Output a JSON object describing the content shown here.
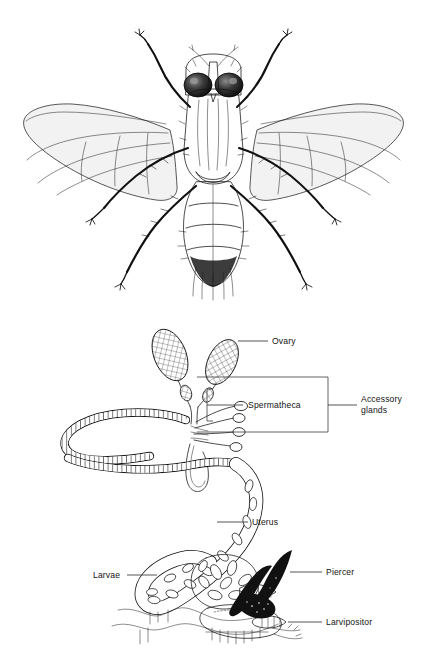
{
  "figure": {
    "background_color": "#ffffff",
    "ink_color": "#111111",
    "label_color": "#141414",
    "panels": [
      {
        "id": "fly-panel",
        "name": "adult-tsetse-fly-illustration",
        "caption": "",
        "description": "Dorsal view line drawing of an adult tsetse fly with outspread wings, six legs, large compound eyes and a banded abdomen"
      },
      {
        "id": "tract-panel",
        "name": "female-reproductive-tract-diagram",
        "caption": "",
        "description": "Labelled line diagram of the female tsetse reproductive tract showing ovaries, spermathecae, accessory glands, coiled uterus with larvae, piercer and larvipositor"
      }
    ]
  },
  "labels": {
    "ovary": "Ovary",
    "spermatheca": "Spermatheca",
    "accessory_glands_line1": "Accessory",
    "accessory_glands_line2": "glands",
    "uterus": "Uterus",
    "larvae": "Larvae",
    "piercer": "Piercer",
    "larvipositor": "Larvipositor"
  },
  "structures": [
    {
      "name": "ovary",
      "label": "Ovary",
      "count": 2,
      "note": "paired cross-hatched ovoid ovaries at top of tract"
    },
    {
      "name": "spermatheca",
      "label": "Spermatheca",
      "count": 4,
      "note": "slender club-tipped ducts grouped by an inner bracket"
    },
    {
      "name": "accessory-glands",
      "label": "Accessory glands",
      "count": 1,
      "note": "outer bracket enclosing spermathecae and gland duct"
    },
    {
      "name": "uterus",
      "label": "Uterus",
      "count": 1,
      "note": "long coiled ladder-textured tube leading to the larva-filled chamber"
    },
    {
      "name": "larvae",
      "label": "Larvae",
      "count": 1,
      "note": "oval larvae packed inside the distended uterus"
    },
    {
      "name": "piercer",
      "label": "Piercer",
      "count": 1,
      "note": "dark sclerotised curved spine at the posterior end"
    },
    {
      "name": "larvipositor",
      "label": "Larvipositor",
      "count": 1,
      "note": "terminal birth opening below the piercer"
    }
  ]
}
